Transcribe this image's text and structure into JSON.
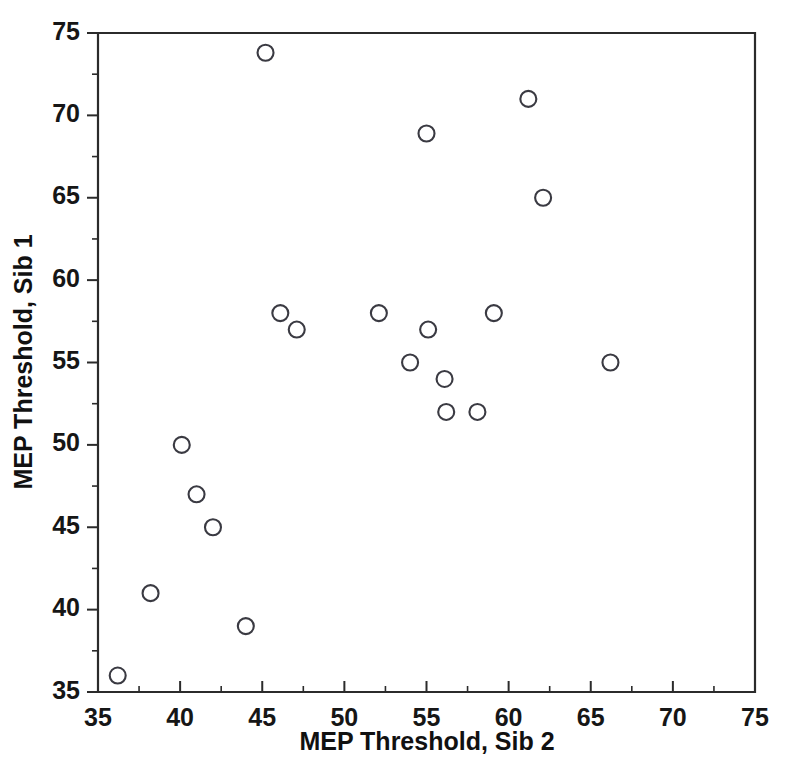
{
  "chart_data": {
    "type": "scatter",
    "title": "",
    "xlabel": "MEP Threshold, Sib 2",
    "ylabel": "MEP Threshold, Sib 1",
    "xlim": [
      35,
      75
    ],
    "ylim": [
      35,
      75
    ],
    "x_major_ticks": [
      35,
      40,
      45,
      50,
      55,
      60,
      65,
      70,
      75
    ],
    "y_major_ticks": [
      35,
      40,
      45,
      50,
      55,
      60,
      65,
      70,
      75
    ],
    "x_minor_ticks": [
      37.5,
      42.5,
      47.5,
      52.5,
      57.5,
      62.5,
      67.5,
      72.5
    ],
    "y_minor_ticks": [
      37.5,
      42.5,
      47.5,
      52.5,
      57.5,
      62.5,
      67.5,
      72.5
    ],
    "x_tick_labels": [
      "35",
      "40",
      "45",
      "50",
      "55",
      "60",
      "65",
      "70",
      "75"
    ],
    "y_tick_labels": [
      "35",
      "40",
      "45",
      "50",
      "55",
      "60",
      "65",
      "70",
      "75"
    ],
    "grid": false,
    "legend": null,
    "marker": "open-circle",
    "marker_color": "#3a3a42",
    "marker_radius": 8,
    "points": [
      {
        "x": 36.2,
        "y": 36.0
      },
      {
        "x": 38.2,
        "y": 41.0
      },
      {
        "x": 40.1,
        "y": 50.0
      },
      {
        "x": 41.0,
        "y": 47.0
      },
      {
        "x": 42.0,
        "y": 45.0
      },
      {
        "x": 44.0,
        "y": 39.0
      },
      {
        "x": 45.2,
        "y": 73.8
      },
      {
        "x": 46.1,
        "y": 58.0
      },
      {
        "x": 47.1,
        "y": 57.0
      },
      {
        "x": 52.1,
        "y": 58.0
      },
      {
        "x": 54.0,
        "y": 55.0
      },
      {
        "x": 55.0,
        "y": 68.9
      },
      {
        "x": 55.1,
        "y": 57.0
      },
      {
        "x": 56.1,
        "y": 54.0
      },
      {
        "x": 56.2,
        "y": 52.0
      },
      {
        "x": 58.1,
        "y": 52.0
      },
      {
        "x": 59.1,
        "y": 58.0
      },
      {
        "x": 61.2,
        "y": 71.0
      },
      {
        "x": 62.1,
        "y": 65.0
      },
      {
        "x": 66.2,
        "y": 55.0
      }
    ],
    "n_points": 20
  },
  "figure": {
    "background_color": "#ffffff",
    "frame_color": "#2b2b2b"
  }
}
